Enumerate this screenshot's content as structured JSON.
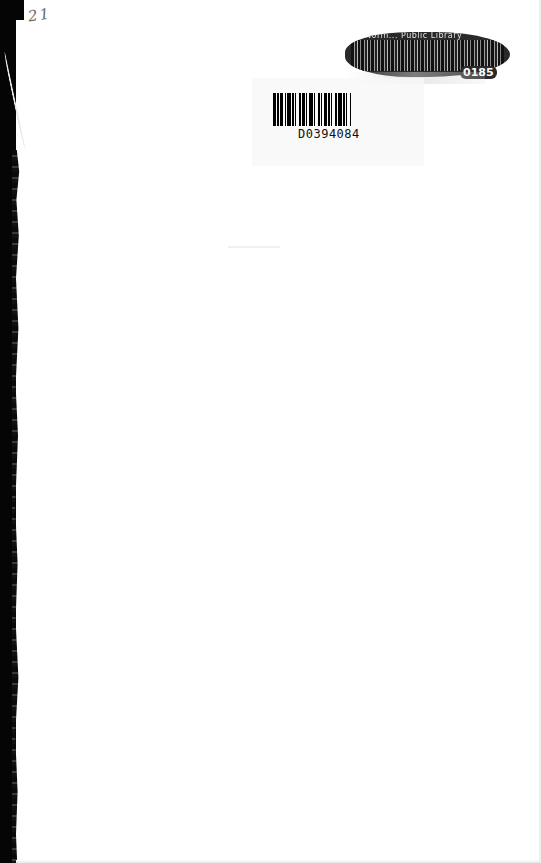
{
  "page": {
    "type": "scanned book endpaper",
    "background": "#ffffff",
    "spine_color": "#050505"
  },
  "handwritten_note": "21",
  "library_barcode": {
    "header_text": "Norm... Public Library",
    "number_suffix": "0185",
    "condition": "smudged"
  },
  "accession_barcode": {
    "number": "D0394084",
    "bars": [
      3,
      1,
      2,
      1,
      3,
      2,
      1,
      1,
      4,
      1,
      2,
      1,
      1,
      3,
      2,
      1,
      3,
      1,
      1,
      2,
      4,
      1,
      1,
      3,
      2,
      1,
      1,
      2,
      3,
      1,
      2,
      1,
      1,
      3,
      2,
      1,
      4,
      1,
      2,
      1,
      1,
      3,
      1,
      2
    ]
  }
}
